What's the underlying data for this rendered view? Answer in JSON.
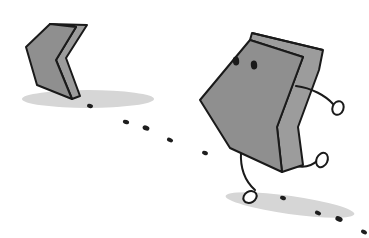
{
  "scene": {
    "description": "Cartoon of a walking chevron/bracket character leaving a trail of footprints, with a static chevron shape behind it",
    "colors": {
      "background": "#ffffff",
      "body_fill": "#8f8f8f",
      "body_side": "#9c9c9c",
      "outline": "#1a1a1a",
      "shadow": "#d6d6d6",
      "footprint": "#1e1e1e"
    },
    "elements": [
      {
        "name": "static-chevron",
        "label": "left-pointing chevron block"
      },
      {
        "name": "walking-chevron-character",
        "label": "chevron character with eyes, arms and legs"
      },
      {
        "name": "footprint-trail",
        "label": "dotted trail of footprints"
      }
    ]
  }
}
